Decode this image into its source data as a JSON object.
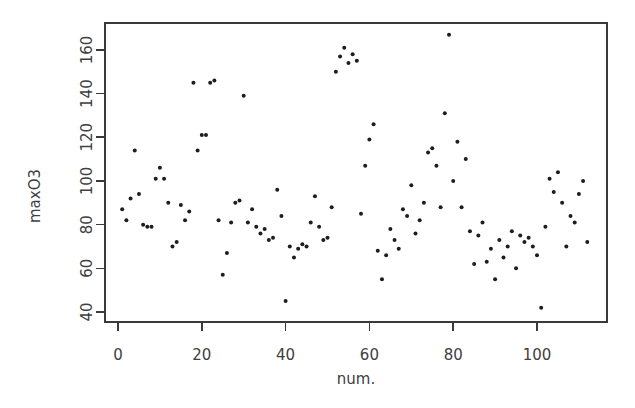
{
  "chart_data": {
    "type": "scatter",
    "title": "",
    "xlabel": "num.",
    "ylabel": "maxO3",
    "xlim": [
      -3,
      116
    ],
    "ylim": [
      36,
      172
    ],
    "grid": false,
    "legend": null,
    "x_ticks": [
      0,
      20,
      40,
      60,
      80,
      100
    ],
    "x_tick_labels": [
      "0",
      "20",
      "40",
      "60",
      "80",
      "100"
    ],
    "y_ticks": [
      40,
      60,
      80,
      100,
      120,
      140,
      160
    ],
    "y_tick_labels": [
      "40",
      "60",
      "80",
      "100",
      "120",
      "140",
      "160"
    ],
    "point_color": "#1d1d1d",
    "point_size": 2.0,
    "n_points": 112,
    "x": [
      1,
      2,
      3,
      4,
      5,
      6,
      7,
      8,
      9,
      10,
      11,
      12,
      13,
      14,
      15,
      16,
      17,
      18,
      19,
      20,
      21,
      22,
      23,
      24,
      25,
      26,
      27,
      28,
      29,
      30,
      31,
      32,
      33,
      34,
      35,
      36,
      37,
      38,
      39,
      40,
      41,
      42,
      43,
      44,
      45,
      46,
      47,
      48,
      49,
      50,
      51,
      52,
      53,
      54,
      55,
      56,
      57,
      58,
      59,
      60,
      61,
      62,
      63,
      64,
      65,
      66,
      67,
      68,
      69,
      70,
      71,
      72,
      73,
      74,
      75,
      76,
      77,
      78,
      79,
      80,
      81,
      82,
      83,
      84,
      85,
      86,
      87,
      88,
      89,
      90,
      91,
      92,
      93,
      94,
      95,
      96,
      97,
      98,
      99,
      100,
      101,
      102,
      103,
      104,
      105,
      106,
      107,
      108,
      109,
      110,
      111,
      112
    ],
    "y": [
      87,
      82,
      92,
      114,
      94,
      80,
      79,
      79,
      101,
      106,
      101,
      90,
      70,
      72,
      89,
      82,
      86,
      145,
      114,
      121,
      121,
      145,
      146,
      82,
      57,
      67,
      81,
      90,
      91,
      139,
      81,
      87,
      79,
      76,
      78,
      73,
      74,
      96,
      84,
      45,
      70,
      65,
      69,
      71,
      70,
      81,
      93,
      79,
      73,
      74,
      88,
      150,
      157,
      161,
      154,
      158,
      155,
      85,
      107,
      119,
      126,
      68,
      55,
      66,
      78,
      73,
      69,
      87,
      84,
      98,
      76,
      82,
      90,
      113,
      115,
      107,
      88,
      131,
      167,
      100,
      118,
      88,
      110,
      77,
      62,
      75,
      81,
      63,
      69,
      55,
      73,
      65,
      70,
      77,
      60,
      75,
      72,
      74,
      70,
      66,
      42,
      79,
      101,
      95,
      104,
      90,
      70,
      84,
      81,
      94,
      100,
      72
    ]
  },
  "plot_geometry": {
    "frame_left": 105,
    "frame_right": 607,
    "frame_top": 23,
    "frame_bottom": 322,
    "x_zero_px": 118,
    "px_per_x_unit": 4.19,
    "y_forty_px": 312,
    "px_per_y_unit": 2.184
  }
}
